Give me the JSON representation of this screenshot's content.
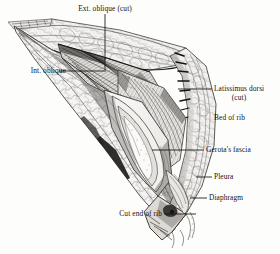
{
  "figure": {
    "type": "pen-and-ink medical illustration",
    "background_color": "#fdfdfc",
    "ink_color": "#131313"
  },
  "labels": [
    {
      "id": "ext-oblique",
      "text": "Ext. oblique (cut)",
      "x": 105,
      "y": 5,
      "align": "center",
      "leader": {
        "x1": 105,
        "y1": 14,
        "x2": 105,
        "y2": 72
      }
    },
    {
      "id": "int-oblique",
      "text": "Int. oblique",
      "x": 33,
      "y": 67,
      "align": "center",
      "leader": {
        "x1": 59,
        "y1": 71,
        "x2": 104,
        "y2": 71
      }
    },
    {
      "id": "latissimus-dorsi-line1",
      "text": "Latissimus dorsi",
      "x": 237,
      "y": 85,
      "align": "center",
      "leader": {
        "x1": 212,
        "y1": 89,
        "x2": 178,
        "y2": 89
      }
    },
    {
      "id": "latissimus-dorsi-line2",
      "text": "(cut)",
      "x": 237,
      "y": 94,
      "align": "center",
      "leader": null
    },
    {
      "id": "bed-of-rib",
      "text": "Bed of rib",
      "x": 232,
      "y": 118,
      "align": "center",
      "leader": null
    },
    {
      "id": "gerotas-fascia",
      "text": "Gerota's fascia",
      "x": 238,
      "y": 146,
      "align": "center",
      "leader": {
        "x1": 204,
        "y1": 150,
        "x2": 152,
        "y2": 150
      }
    },
    {
      "id": "pleura",
      "text": "Pleura",
      "x": 231,
      "y": 173,
      "align": "center",
      "leader": {
        "x1": 212,
        "y1": 177,
        "x2": 196,
        "y2": 177
      }
    },
    {
      "id": "diaphragm",
      "text": "Diaphragm",
      "x": 235,
      "y": 194,
      "align": "center",
      "leader": {
        "x1": 207,
        "y1": 198,
        "x2": 190,
        "y2": 198
      }
    },
    {
      "id": "cut-end-of-rib",
      "text": "Cut end of rib",
      "x": 134,
      "y": 210,
      "align": "center",
      "leader": {
        "x1": 164,
        "y1": 214,
        "x2": 196,
        "y2": 214
      }
    }
  ]
}
